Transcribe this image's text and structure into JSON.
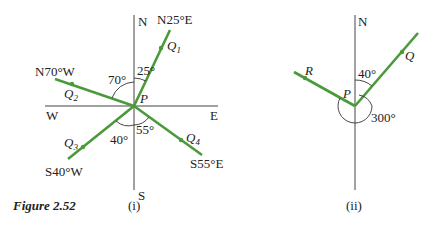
{
  "figure": {
    "caption": "Figure 2.52",
    "colors": {
      "bearing_line": "#4a9a3a",
      "axis": "#444444",
      "text": "#222222"
    }
  },
  "diagram_i": {
    "label": "(i)",
    "compass": {
      "north": "N",
      "south": "S",
      "west": "W",
      "east": "E"
    },
    "center_label": "P",
    "bearings": [
      {
        "point": "Q1",
        "point_main": "Q",
        "point_sub": "1",
        "bearing": "N25°E",
        "angle_label": "25°"
      },
      {
        "point": "Q2",
        "point_main": "Q",
        "point_sub": "2",
        "bearing": "N70°W",
        "angle_label": "70°"
      },
      {
        "point": "Q3",
        "point_main": "Q",
        "point_sub": "3",
        "bearing": "S40°W",
        "angle_label": "40°"
      },
      {
        "point": "Q4",
        "point_main": "Q",
        "point_sub": "4",
        "bearing": "S55°E",
        "angle_label": "55°"
      }
    ]
  },
  "diagram_ii": {
    "label": "(ii)",
    "compass": {
      "north": "N"
    },
    "center_label": "P",
    "points": [
      "R",
      "Q"
    ],
    "angle_labels": [
      "40°",
      "300°"
    ]
  }
}
